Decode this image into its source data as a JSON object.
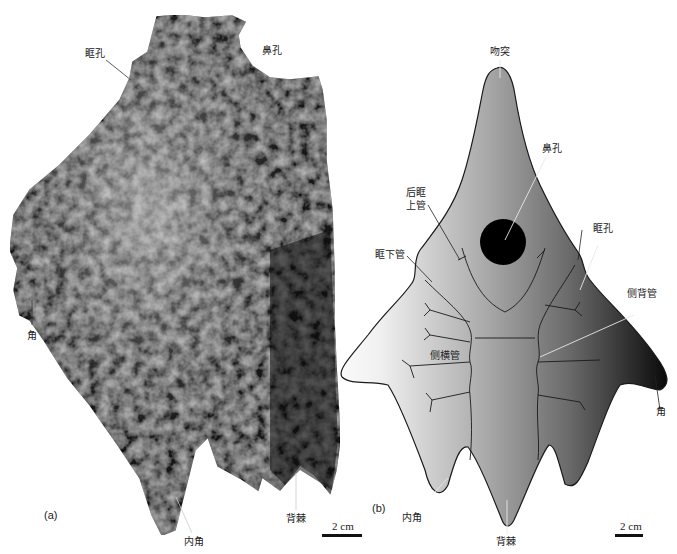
{
  "figure": {
    "panel_a": {
      "panel_label": "(a)",
      "description": "Photograph of fossil headshield",
      "labels": {
        "orbit": "眶孔",
        "nasal_opening": "鼻孔",
        "cornual_process": "角",
        "inner_cornual_process": "内角",
        "median_dorsal_spine": "背棘"
      },
      "scale_bar": "2 cm"
    },
    "panel_b": {
      "panel_label": "(b)",
      "description": "Interpretive drawing of headshield",
      "labels": {
        "rostral_process": "吻突",
        "nasal_opening": "鼻孔",
        "posterior_supraorbital_canal_line1": "后眶",
        "posterior_supraorbital_canal_line2": "上管",
        "orbit": "眶孔",
        "infraorbital_canal": "眶下管",
        "dorsal_lateral_canal": "侧背管",
        "lateral_transverse_canal": "侧横管",
        "cornual_process": "角",
        "inner_cornual_process": "内角",
        "median_dorsal_spine": "背棘"
      },
      "scale_bar": "2 cm"
    },
    "colors": {
      "background": "#ffffff",
      "fossil_dark": "#1a1a1a",
      "drawing_light": "#f4f4f4",
      "drawing_mid": "#8a8a8a",
      "drawing_dark": "#111111",
      "nasal_opening_fill": "#000000",
      "outline": "#1a1a1a"
    }
  }
}
